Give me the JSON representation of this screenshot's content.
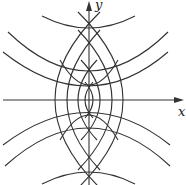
{
  "diagram": {
    "type": "orthogonal parabola families",
    "axes": {
      "x_label": "x",
      "y_label": "y"
    },
    "stroke_color": "#333333"
  }
}
